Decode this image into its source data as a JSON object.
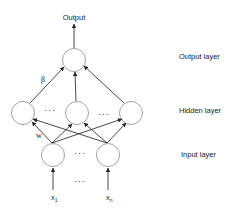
{
  "diagram": {
    "output_label": "Output",
    "layers": [
      {
        "name": "output",
        "label": "Output layer"
      },
      {
        "name": "hidden",
        "label": "Hidden layer"
      },
      {
        "name": "input",
        "label": "Input layer"
      }
    ],
    "weights": {
      "output_weight": "β",
      "input_weight": "w"
    },
    "inputs": [
      {
        "label": "x",
        "subscript": "1"
      },
      {
        "label": "x",
        "subscript": "n"
      }
    ],
    "ellipsis": "···",
    "colors": {
      "stroke": "#333333",
      "node_stroke": "#999999",
      "background": "#ffffff"
    }
  }
}
